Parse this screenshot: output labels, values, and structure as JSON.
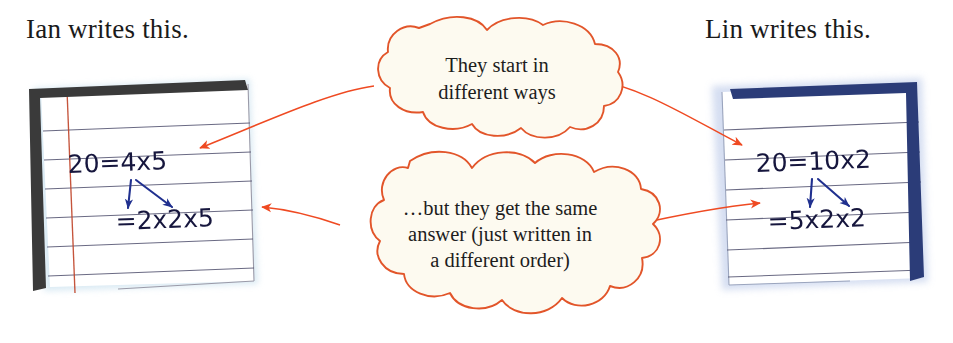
{
  "page": {
    "width": 953,
    "height": 343,
    "background": "#ffffff"
  },
  "headings": {
    "left": "Ian writes this.",
    "right": "Lin writes this."
  },
  "clouds": {
    "top": {
      "lines": [
        "They start in",
        "different ways"
      ],
      "outline_color": "#e2552a",
      "fill_color": "#fdfaf0"
    },
    "bottom": {
      "lines": [
        "…but they get the same",
        "answer (just written in",
        "a different order)"
      ],
      "outline_color": "#e2552a",
      "fill_color": "#fdfaf0"
    }
  },
  "notebooks": {
    "left": {
      "owner": "Ian",
      "binding_color": "#3c3c3c",
      "binding_side": "left",
      "margin_line_color": "#c4452b",
      "rule_line_color": "#5a5a78",
      "paper_color": "#ffffff",
      "ink_color": "#14143c",
      "lines": [
        "20 = 4 × 5",
        "= 2 × 2 × 5"
      ],
      "line1_plain": "20=4x5",
      "line2_plain": "=2x2x5",
      "arrows": [
        {
          "from": "4",
          "to": "2",
          "direction": "down"
        },
        {
          "from": "4",
          "to": "2",
          "direction": "down-right"
        }
      ]
    },
    "right": {
      "owner": "Lin",
      "binding_color": "#2b3c78",
      "binding_side": "right",
      "rule_line_color": "#5a5a78",
      "paper_color": "#ffffff",
      "ink_color": "#14143c",
      "lines": [
        "20 = 10 × 2",
        "= 5 × 2 × 2"
      ],
      "line1_plain": "20=10x2",
      "line2_plain": "=5x2x2",
      "arrows": [
        {
          "from": "10",
          "to": "5",
          "direction": "down"
        },
        {
          "from": "10",
          "to": "2",
          "direction": "down-right"
        }
      ]
    }
  },
  "connectors": [
    {
      "name": "top-cloud-to-left-note",
      "color": "#e2552a",
      "points_to": "left"
    },
    {
      "name": "top-cloud-to-right-note",
      "color": "#e2552a",
      "points_to": "right"
    },
    {
      "name": "bottom-cloud-to-left-note",
      "color": "#e2552a",
      "points_to": "left"
    },
    {
      "name": "bottom-cloud-to-right-note",
      "color": "#e2552a",
      "points_to": "right"
    }
  ]
}
